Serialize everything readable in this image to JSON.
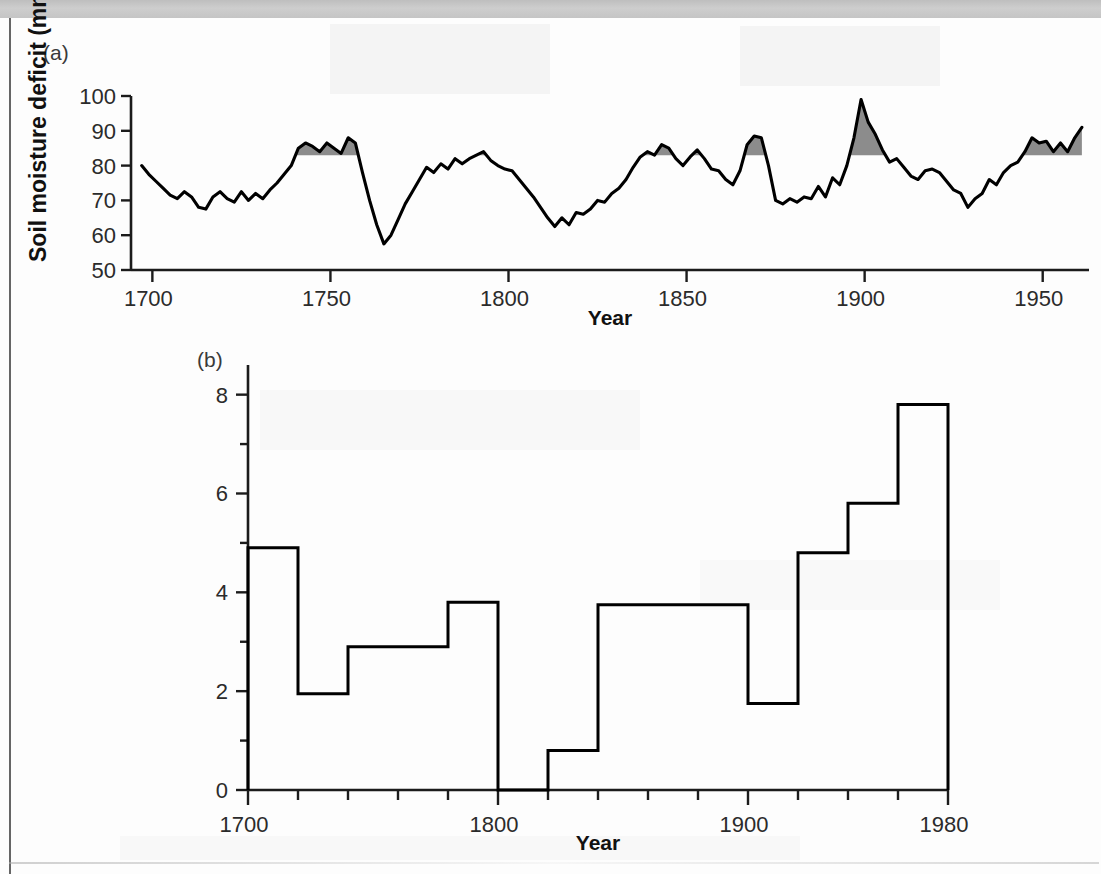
{
  "figure": {
    "panel_a_label": "(a)",
    "panel_b_label": "(b)"
  },
  "chart_data": [
    {
      "type": "line",
      "panel": "(a)",
      "title": "",
      "xlabel": "Year",
      "ylabel": "Soil moisture deficit (mm)",
      "xlim": [
        1694,
        1963
      ],
      "ylim": [
        50,
        100
      ],
      "xticks": [
        1700,
        1750,
        1800,
        1850,
        1900,
        1950
      ],
      "xtick_labels": [
        "1700",
        "1750",
        "1800",
        "1850",
        "1900",
        "1950"
      ],
      "yticks": [
        50,
        60,
        70,
        80,
        90,
        100
      ],
      "ytick_labels": [
        "50",
        "60",
        "70",
        "80",
        "90",
        "100"
      ],
      "grid": false,
      "legend": "none",
      "shading": {
        "description": "grey fill between curve and threshold where deficit exceeds threshold",
        "threshold": 83,
        "color": "#8c8c8c"
      },
      "x": [
        1697,
        1699,
        1701,
        1703,
        1705,
        1707,
        1709,
        1711,
        1713,
        1715,
        1717,
        1719,
        1721,
        1723,
        1725,
        1727,
        1729,
        1731,
        1733,
        1735,
        1737,
        1739,
        1741,
        1743,
        1745,
        1747,
        1749,
        1751,
        1753,
        1755,
        1757,
        1759,
        1761,
        1763,
        1765,
        1767,
        1769,
        1771,
        1773,
        1775,
        1777,
        1779,
        1781,
        1783,
        1785,
        1787,
        1789,
        1791,
        1793,
        1795,
        1797,
        1799,
        1801,
        1803,
        1805,
        1807,
        1809,
        1811,
        1813,
        1815,
        1817,
        1819,
        1821,
        1823,
        1825,
        1827,
        1829,
        1831,
        1833,
        1835,
        1837,
        1839,
        1841,
        1843,
        1845,
        1847,
        1849,
        1851,
        1853,
        1855,
        1857,
        1859,
        1861,
        1863,
        1865,
        1867,
        1869,
        1871,
        1873,
        1875,
        1877,
        1879,
        1881,
        1883,
        1885,
        1887,
        1889,
        1891,
        1893,
        1895,
        1897,
        1899,
        1901,
        1903,
        1905,
        1907,
        1909,
        1911,
        1913,
        1915,
        1917,
        1919,
        1921,
        1923,
        1925,
        1927,
        1929,
        1931,
        1933,
        1935,
        1937,
        1939,
        1941,
        1943,
        1945,
        1947,
        1949,
        1951,
        1953,
        1955,
        1957,
        1959,
        1961
      ],
      "y": [
        80,
        77.5,
        75.5,
        73.5,
        71.5,
        70.5,
        72.5,
        71,
        68,
        67.5,
        71,
        72.5,
        70.5,
        69.5,
        72.5,
        70,
        72,
        70.5,
        73,
        75,
        77.5,
        80,
        85,
        86.5,
        85.5,
        84,
        86.5,
        85,
        83.5,
        88,
        86.5,
        78,
        70,
        63,
        57.5,
        60,
        64.5,
        69,
        72.5,
        76,
        79.5,
        78,
        80.5,
        79,
        82,
        80.5,
        82,
        83,
        84,
        81.5,
        80,
        79,
        78.5,
        76,
        73.5,
        71,
        68,
        65,
        62.5,
        65,
        63,
        66.5,
        66,
        67.5,
        70,
        69.5,
        72,
        73.5,
        76,
        79.5,
        82.5,
        84,
        83,
        86,
        85,
        82,
        80,
        82.5,
        84.5,
        82,
        79,
        78.5,
        76,
        74.5,
        78.5,
        86,
        88.5,
        88,
        80,
        70,
        69,
        70.5,
        69.5,
        71,
        70.5,
        74,
        71,
        76.5,
        74.5,
        80,
        88,
        99,
        92.5,
        89,
        84.5,
        81,
        82,
        79.5,
        77,
        76,
        78.5,
        79,
        78,
        75.5,
        73,
        72,
        68,
        70.5,
        72,
        76,
        74.5,
        78,
        80,
        81,
        84,
        88,
        86.5,
        87,
        84,
        86.5,
        84,
        88,
        91,
        89.5,
        85.5,
        82.5,
        78,
        80.5,
        81.5
      ]
    },
    {
      "type": "bar",
      "panel": "(b)",
      "title": "",
      "xlabel": "Year",
      "ylabel": "",
      "xlim": [
        1700,
        1980
      ],
      "ylim": [
        0,
        8.6
      ],
      "xticks": [
        1700,
        1800,
        1900,
        1980
      ],
      "xtick_labels": [
        "1700",
        "1800",
        "1900",
        "1980"
      ],
      "xminor_step": 20,
      "yticks": [
        0,
        2,
        4,
        6,
        8
      ],
      "ytick_labels": [
        "0",
        "2",
        "4",
        "6",
        "8"
      ],
      "yminor_step": 1,
      "grid": false,
      "legend": "none",
      "style": "step-histogram",
      "bin_width": 20,
      "bin_starts": [
        1700,
        1720,
        1740,
        1760,
        1780,
        1800,
        1820,
        1840,
        1860,
        1880,
        1900,
        1920,
        1940,
        1960
      ],
      "bin_ends": [
        1720,
        1740,
        1760,
        1780,
        1800,
        1820,
        1840,
        1860,
        1880,
        1900,
        1920,
        1940,
        1960,
        1980
      ],
      "values": [
        4.9,
        1.95,
        2.9,
        2.9,
        3.8,
        0.0,
        0.8,
        3.75,
        3.75,
        3.75,
        1.75,
        4.8,
        5.8,
        7.8
      ]
    }
  ]
}
